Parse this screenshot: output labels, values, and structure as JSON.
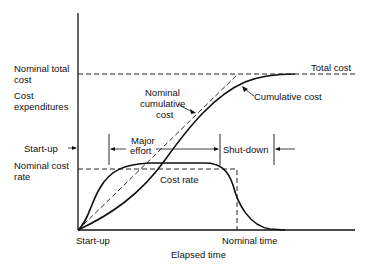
{
  "diagram": {
    "y_labels": {
      "nominal_total_cost_1": "Nominal total",
      "nominal_total_cost_2": "cost",
      "cost_expenditures_1": "Cost",
      "cost_expenditures_2": "expenditures",
      "start_up": "Start-up",
      "nominal_cost_rate_1": "Nominal cost",
      "nominal_cost_rate_2": "rate"
    },
    "x_labels": {
      "start_up": "Start-up",
      "nominal_time": "Nominal time",
      "axis_title": "Elapsed time"
    },
    "annotations": {
      "total_cost": "Total cost",
      "cumulative_cost": "Cumulative cost",
      "nominal_cumulative_1": "Nominal",
      "nominal_cumulative_2": "cumulative",
      "nominal_cumulative_3": "cost",
      "major_effort_1": "Major",
      "major_effort_2": "effort",
      "shut_down": "Shut-down",
      "cost_rate": "Cost rate"
    },
    "colors": {
      "line": "#111111",
      "background": "#ffffff"
    }
  }
}
